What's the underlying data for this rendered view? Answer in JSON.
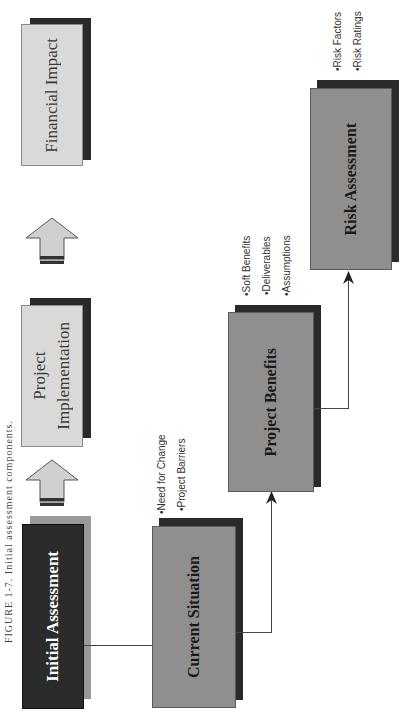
{
  "caption": "FIGURE 1-7.  Initial assessment components.",
  "boxes": {
    "financial_impact": "Financial Impact",
    "project_implementation": "Project\nImplementation",
    "project_implementation_line1": "Project",
    "project_implementation_line2": "Implementation",
    "initial_assessment": "Initial Assessment",
    "current_situation": "Current Situation",
    "project_benefits": "Project Benefits",
    "risk_assessment": "Risk Assessment"
  },
  "bullets": {
    "current_situation": [
      "•Need for Change",
      "•Project Barriers"
    ],
    "project_benefits": [
      "•Soft Benefits",
      "•Deliverables",
      "•Assumptions"
    ],
    "risk_assessment": [
      "•Risk Factors",
      "•Risk Ratings"
    ]
  },
  "colors": {
    "light_box": "#d9d9d9",
    "mid_box": "#8f8f8f",
    "dark_box": "#2b2b2b",
    "shadow": "#2a2a2a"
  }
}
